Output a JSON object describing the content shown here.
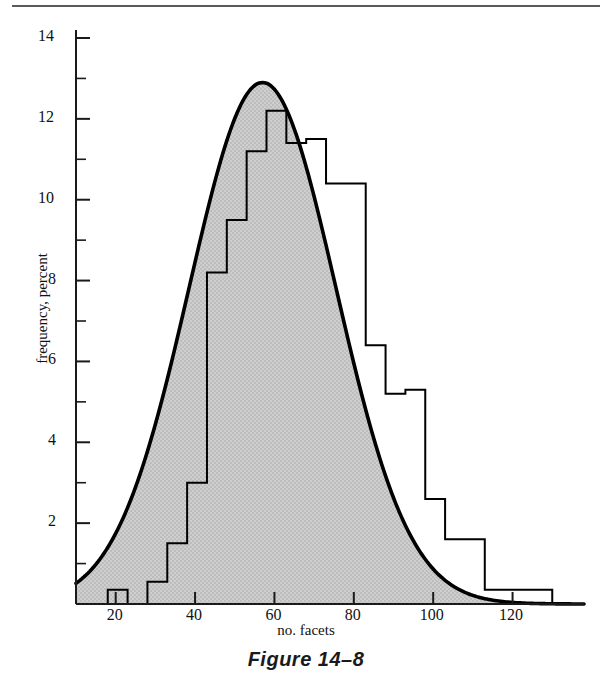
{
  "caption": "Figure 14–8",
  "axes": {
    "ylabel": "frequency, percent",
    "xlabel": "no. facets",
    "y_ticks": [
      "2",
      "4",
      "6",
      "8",
      "10",
      "12",
      "14"
    ],
    "y_tick_values": [
      2,
      4,
      6,
      8,
      10,
      12,
      14
    ],
    "y_minor_values": [
      1,
      3,
      5,
      7,
      9,
      11,
      13
    ],
    "x_ticks": [
      "20",
      "40",
      "60",
      "80",
      "100",
      "120"
    ],
    "x_tick_values": [
      20,
      40,
      60,
      80,
      100,
      120
    ]
  },
  "colors": {
    "fill": "#c9c9c9",
    "curve": "#000000",
    "histogram": "#000000",
    "axis": "#1a1a1a",
    "rule": "#5a5a5a"
  },
  "chart_data": {
    "type": "histogram",
    "title": "Figure 14–8",
    "xlabel": "no. facets",
    "ylabel": "frequency, percent",
    "xlim": [
      10,
      138
    ],
    "ylim": [
      0,
      14
    ],
    "grid": false,
    "legend": null,
    "bin_width": 5,
    "histogram_bins": [
      {
        "x0": 18,
        "x1": 23,
        "value": 0.35
      },
      {
        "x0": 23,
        "x1": 28,
        "value": 0.0
      },
      {
        "x0": 28,
        "x1": 33,
        "value": 0.55
      },
      {
        "x0": 33,
        "x1": 38,
        "value": 1.5
      },
      {
        "x0": 38,
        "x1": 43,
        "value": 3.0
      },
      {
        "x0": 43,
        "x1": 48,
        "value": 8.2
      },
      {
        "x0": 48,
        "x1": 53,
        "value": 9.5
      },
      {
        "x0": 53,
        "x1": 58,
        "value": 11.2
      },
      {
        "x0": 58,
        "x1": 63,
        "value": 12.2
      },
      {
        "x0": 63,
        "x1": 68,
        "value": 11.4
      },
      {
        "x0": 68,
        "x1": 73,
        "value": 11.5
      },
      {
        "x0": 73,
        "x1": 78,
        "value": 10.4
      },
      {
        "x0": 78,
        "x1": 83,
        "value": 10.4
      },
      {
        "x0": 83,
        "x1": 88,
        "value": 6.4
      },
      {
        "x0": 88,
        "x1": 93,
        "value": 5.2
      },
      {
        "x0": 93,
        "x1": 98,
        "value": 5.3
      },
      {
        "x0": 98,
        "x1": 103,
        "value": 2.6
      },
      {
        "x0": 103,
        "x1": 108,
        "value": 1.6
      },
      {
        "x0": 108,
        "x1": 113,
        "value": 1.6
      },
      {
        "x0": 113,
        "x1": 118,
        "value": 0.35
      },
      {
        "x0": 118,
        "x1": 123,
        "value": 0.35
      },
      {
        "x0": 123,
        "x1": 130,
        "value": 0.35
      }
    ],
    "fitted_curve": {
      "name": "normal curve",
      "distribution": "normal",
      "mean": 57,
      "sigma": 18.5,
      "peak_value": 12.9,
      "shaded": true
    }
  }
}
